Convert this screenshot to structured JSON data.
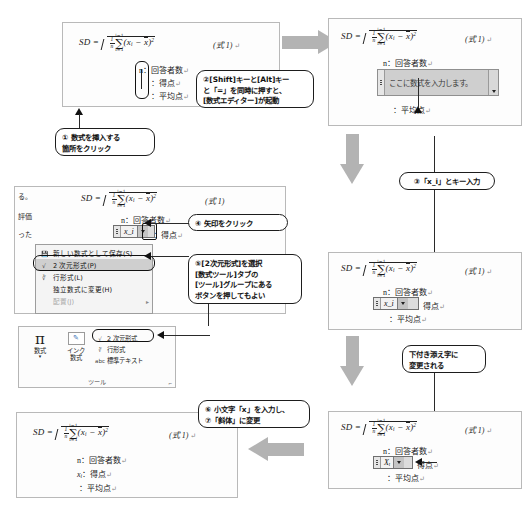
{
  "document": {
    "formula_label": "SD =",
    "equation_number": "(式 1)",
    "pilcrow": "↵",
    "fraction_numerator": "1",
    "fraction_denominator": "n",
    "sigma_upper": "n",
    "sigma_lower": "i=1",
    "sigma_body_open": "(x",
    "sigma_body_sub": "i",
    "sigma_body_minus": " − ",
    "sigma_body_mean": "x",
    "sigma_body_close": ")",
    "sigma_body_power": "2",
    "legend_n": "n：回答者数",
    "legend_score_label": "：得点",
    "legend_score_var": "x",
    "legend_score_sub": "i",
    "legend_score_var_upper": "X",
    "legend_mean": "：平均点"
  },
  "panels": {
    "step1": {
      "name": "step1-document"
    },
    "step2": {
      "name": "step2-document"
    },
    "step3": {
      "name": "step3-document"
    },
    "step4": {
      "name": "step4-document"
    },
    "step5": {
      "name": "step5-word-window"
    },
    "step6": {
      "name": "step6-ribbon"
    }
  },
  "equation_editor": {
    "placeholder": "ここに数式を入力します。",
    "typed_value": "x_i",
    "subscripted_value": "Xᵢ",
    "final_value": "Xᵢ"
  },
  "callouts": [
    {
      "id": "callout-1",
      "text": "① 数式を挿入する\n箇所をクリック"
    },
    {
      "id": "callout-2",
      "text": "②[Shift]キーと[Alt]キー\nと「=」を同時に押すと、\n[数式エディター]が起動"
    },
    {
      "id": "callout-3",
      "text": "③「x_i」とキー入力"
    },
    {
      "id": "callout-4",
      "text": "下付き添え字に\n変更される"
    },
    {
      "id": "callout-5",
      "text": "④ 矢印をクリック"
    },
    {
      "id": "callout-6",
      "text": "⑤[2次元形式]を選択\n[数式ツール]タブの\n[ツール]グループにある\nボタンを押してもよい"
    },
    {
      "id": "callout-7",
      "text": "⑥ 小文字「x」を入力し、\n⑦「斜体」に変更"
    }
  ],
  "context_menu": {
    "items": [
      {
        "label": "新しい数式として保存(S)...",
        "icon": "save-icon",
        "selected": false,
        "disabled": false,
        "submenu": ""
      },
      {
        "label": "2 次元形式(P)",
        "icon": "twod-icon",
        "selected": true,
        "disabled": false,
        "submenu": ""
      },
      {
        "label": "行形式(L)",
        "icon": "linear-icon",
        "selected": false,
        "disabled": false,
        "submenu": ""
      },
      {
        "label": "独立数式に変更(H)",
        "icon": "",
        "selected": false,
        "disabled": false,
        "submenu": ""
      },
      {
        "label": "配置(J)",
        "icon": "",
        "selected": false,
        "disabled": true,
        "submenu": "▸"
      }
    ]
  },
  "ribbon": {
    "buttons": [
      {
        "label": "数式",
        "caret": "▾",
        "icon": "pi-icon"
      },
      {
        "label": "インク\n数式",
        "icon": "ink-equation-icon"
      }
    ],
    "small_buttons": [
      {
        "label": "2 次元形式",
        "icon": "twod-icon"
      },
      {
        "label": "行形式",
        "icon": "linear-icon"
      },
      {
        "label": "標準テキスト",
        "icon": "abc-icon"
      }
    ],
    "group_label": "ツール",
    "launcher": "⌐"
  },
  "document_fragments": [
    "る。",
    "評価",
    "った"
  ],
  "colors": {
    "block_arrow": "#b3b3b3",
    "editor_fill": "#cfcfcf",
    "menu_highlight": "#cfcfcf",
    "outline": "#1d1d1d",
    "panel_border": "#b9b9b9"
  }
}
